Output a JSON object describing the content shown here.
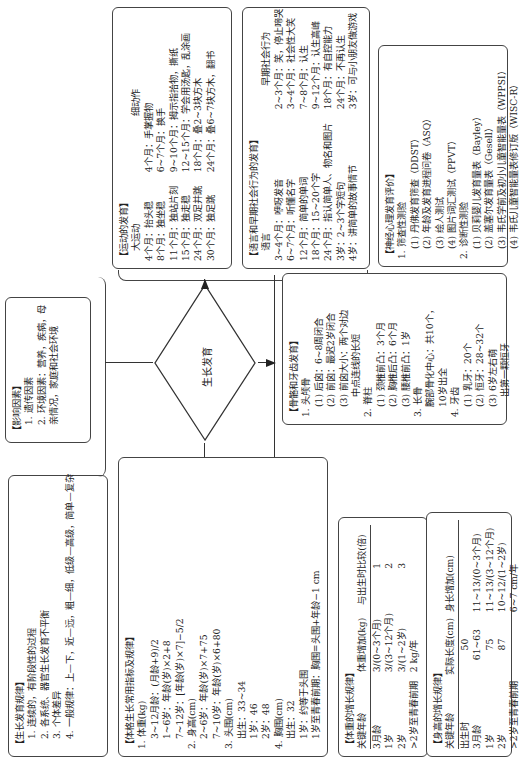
{
  "center": {
    "label": "生长发育"
  },
  "laws": {
    "title": "生长发育规律",
    "lines": [
      "1. 连续的，有阶段性的过程",
      "2. 各系统、器官生长发育不平衡",
      "3. 个体差异",
      "4. 一般规律：上—下，近—远，粗—细，低级—高级，简单—复杂"
    ]
  },
  "factors": {
    "title": "影响因素",
    "lines": [
      "1. 遗传因素",
      "2. 环境因素：营养，疾病，母亲情况，家庭和社会环境"
    ]
  },
  "motor": {
    "title": "运动的发育",
    "gross_head": "大运动",
    "fine_head": "细动作",
    "gross": [
      "4个月：抬头稳",
      "8个月：独坐稳",
      "11个月：独站片刻",
      "15个月：独走稳",
      "24个月：双足并跳",
      "30个月：独足跳"
    ],
    "fine": [
      "4个月：手掌握物",
      "6~7个月：换手",
      "9~10个月：拇示指拾物，撕纸",
      "12~15个月：学会用汤匙，乱涂画",
      "18个月：叠2~3块方木",
      "24个月：叠6~7块方木，翻书"
    ]
  },
  "language": {
    "title": "语言和早期社会行为的发育",
    "lang_head": "语言",
    "social_head": "早期社会行为",
    "lang": [
      "3~4个月：咿呀发音",
      "6~7个月：听懂名字",
      "12个月：简单的单词",
      "18个月：15~20个字",
      "24个月：指认简单人、物名和图片",
      "3岁：2~3个字短句",
      "4岁：讲简单的故事情节"
    ],
    "social": [
      "2~3个月：笑，停止啼哭",
      "3~4个月：社会性大笑",
      "7~8个月：认生",
      "9~12个月：认生高峰",
      "18个月：有自控能力",
      "24个月：不再认生",
      "3岁：可与小朋友做游戏"
    ]
  },
  "neuro": {
    "title": "神经心理发育评价",
    "lines": [
      "1. 筛查性测验",
      "(1) 丹佛发育筛查（DDST）",
      "(2) 年龄及发育进程问卷（ASQ）",
      "(3) 绘人测试",
      "(4) 图片词汇测试（PPVT）",
      "2. 诊断性测验",
      "(1) 贝莉婴儿发育量表（Bayley）",
      "(2) 盖塞尔发育量表（Gesell）",
      "(3) 韦氏学前及初小儿童智能量表（WPPSI）",
      "(4) 韦氏儿童智能量表修订版（WISC-R）"
    ]
  },
  "bones": {
    "title": "骨骼和牙齿发育",
    "lines": [
      "1. 头颅骨",
      "(1) 后囟：6~8周闭合",
      "(2) 前囟：最迟2岁闭合",
      "(3) 前囟大小：两个对边",
      "     中点连线的长短",
      "2. 脊柱",
      "(1) 颈椎前凸：3个月",
      "(2) 胸椎后凸：6个月",
      "(3) 腰椎前凸：1岁",
      "3. 长骨",
      "腕部骨化中心：共10个，",
      "10岁出全",
      "4. 牙齿",
      "(1) 乳牙：20个",
      "(2) 恒牙：28~32个",
      "(3) 6岁左右萌",
      "     出第一颗恒牙"
    ]
  },
  "indicators": {
    "title": "体格生长常用指标及规律",
    "lines": [
      "1. 体重(kg)",
      "3~12月龄：(月龄+9)/2",
      "1~6岁：年龄(岁)×2+8",
      "7~12岁：[年龄(岁)×7]−5/2",
      "2. 身高(cm)",
      "2~6岁：年龄(岁)×7+75",
      "7~10岁：年龄(岁)×6+80",
      "3. 头围(cm)",
      "出生：33~34",
      "1岁：46",
      "2岁：48",
      "4. 胸围(cm)",
      "出生：32",
      "1岁：约等于头围",
      "1岁至青春前期：胸围=头围+年龄−1 cm"
    ]
  },
  "weight_table": {
    "title": "体重的增长规律",
    "headers": [
      "关键年龄",
      "体重增加(kg)",
      "与出生时比较(倍)"
    ],
    "rows": [
      [
        "3月龄",
        "3/(0~3个月)",
        "1"
      ],
      [
        "1岁",
        "3/(3~12个月)",
        "2"
      ],
      [
        "2岁",
        "3/(1~2岁)",
        "3"
      ],
      [
        ">2岁至青春前期",
        "2 kg/年",
        ""
      ]
    ]
  },
  "height_table": {
    "title": "身高的增长规律",
    "headers": [
      "关键年龄",
      "实际长度(cm)",
      "身长增加(cm)"
    ],
    "rows": [
      [
        "出生时",
        "50",
        ""
      ],
      [
        "3月龄",
        "61~63",
        "11~13/(0~3个月)"
      ],
      [
        "1岁",
        "75",
        "11~13/(3~12个月)"
      ],
      [
        "2岁",
        "87",
        "10~12/(1~2岁)"
      ],
      [
        ">2岁至青春前期",
        "",
        "6~7 cm/年"
      ]
    ]
  }
}
